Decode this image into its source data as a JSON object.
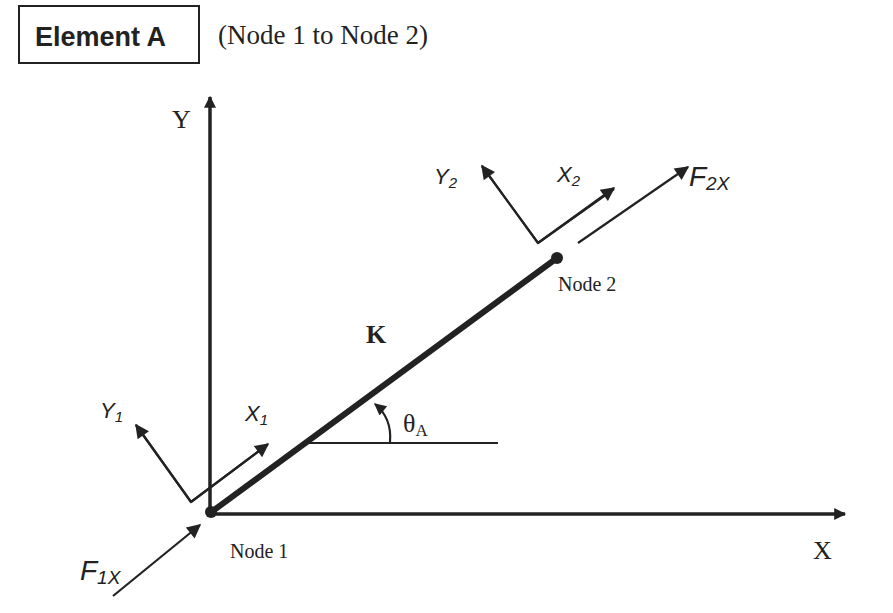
{
  "title": {
    "element_label": "Element A",
    "subtitle": "(Node 1 to Node 2)"
  },
  "axes": {
    "x_label": "X",
    "y_label": "Y"
  },
  "element": {
    "stiffness_label": "K",
    "angle_symbol": "θ",
    "angle_subscript": "A"
  },
  "nodes": [
    {
      "label": "Node 1",
      "local_x": {
        "base": "X",
        "sub": "1"
      },
      "local_y": {
        "base": "Y",
        "sub": "1"
      },
      "force": {
        "base": "F",
        "sub": "1X"
      }
    },
    {
      "label": "Node 2",
      "local_x": {
        "base": "X",
        "sub": "2"
      },
      "local_y": {
        "base": "Y",
        "sub": "2"
      },
      "force": {
        "base": "F",
        "sub": "2X"
      }
    }
  ],
  "colors": {
    "ink": "#222222",
    "background": "#ffffff"
  }
}
